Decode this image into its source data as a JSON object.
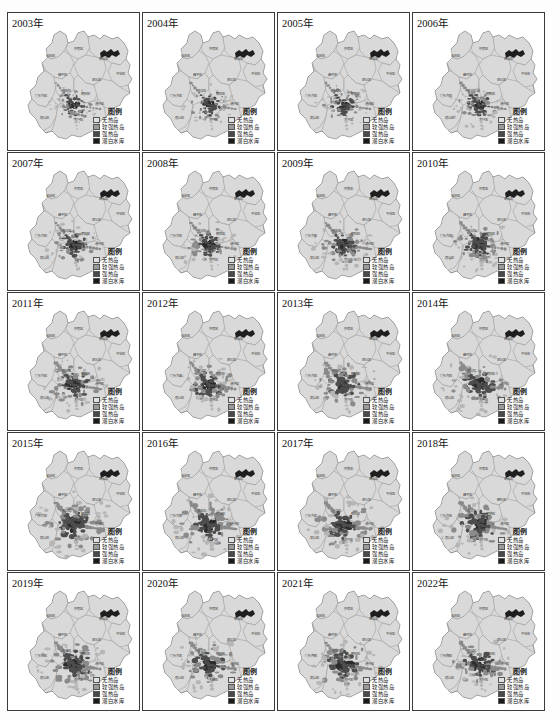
{
  "figure": {
    "kind": "map-grid",
    "rows": 5,
    "cols": 4,
    "background": "#ffffff",
    "border_color": "#3a3a3a"
  },
  "legend": {
    "title": "图例",
    "entries": [
      {
        "label": "无热岛",
        "color": "#e0e0e0"
      },
      {
        "label": "较强热岛",
        "color": "#9a9a9a"
      },
      {
        "label": "强热岛",
        "color": "#4a4a4a"
      },
      {
        "label": "潮白水库",
        "color": "#1a1a1a"
      }
    ]
  },
  "palette": {
    "land_fill": "#d9d9d9",
    "land_stroke": "#8c8c8c",
    "outline": "#6e6e6e",
    "heat_weak": "#b5b5b5",
    "heat_mid": "#8a8a8a",
    "heat_strong": "#4d4d4d",
    "heat_core": "#2b2b2b",
    "reservoir": "#1e1e1e",
    "label_text": "#4a4a4a"
  },
  "district_labels": [
    {
      "name": "延庆区",
      "x": 42,
      "y": 44
    },
    {
      "name": "怀柔区",
      "x": 70,
      "y": 37
    },
    {
      "name": "密云区",
      "x": 95,
      "y": 47
    },
    {
      "name": "昌平区",
      "x": 54,
      "y": 63
    },
    {
      "name": "顺义区",
      "x": 88,
      "y": 68
    },
    {
      "name": "平谷区",
      "x": 112,
      "y": 62
    },
    {
      "name": "门头沟区",
      "x": 33,
      "y": 84
    },
    {
      "name": "海淀区",
      "x": 58,
      "y": 79
    },
    {
      "name": "朝阳区",
      "x": 77,
      "y": 82
    },
    {
      "name": "通州区",
      "x": 91,
      "y": 92
    },
    {
      "name": "房山区",
      "x": 36,
      "y": 106
    },
    {
      "name": "大兴区",
      "x": 70,
      "y": 108
    }
  ],
  "panels": [
    {
      "id": "p2003",
      "year": "2003年",
      "heat_scale": 0.6,
      "heat_seed": 3
    },
    {
      "id": "p2004",
      "year": "2004年",
      "heat_scale": 0.64,
      "heat_seed": 4
    },
    {
      "id": "p2005",
      "year": "2005年",
      "heat_scale": 0.67,
      "heat_seed": 5
    },
    {
      "id": "p2006",
      "year": "2006年",
      "heat_scale": 0.7,
      "heat_seed": 6
    },
    {
      "id": "p2007",
      "year": "2007年",
      "heat_scale": 0.73,
      "heat_seed": 7
    },
    {
      "id": "p2008",
      "year": "2008年",
      "heat_scale": 0.76,
      "heat_seed": 8
    },
    {
      "id": "p2009",
      "year": "2009年",
      "heat_scale": 0.78,
      "heat_seed": 9
    },
    {
      "id": "p2010",
      "year": "2010年",
      "heat_scale": 0.81,
      "heat_seed": 10
    },
    {
      "id": "p2011",
      "year": "2011年",
      "heat_scale": 0.84,
      "heat_seed": 11
    },
    {
      "id": "p2012",
      "year": "2012年",
      "heat_scale": 0.86,
      "heat_seed": 12
    },
    {
      "id": "p2013",
      "year": "2013年",
      "heat_scale": 0.89,
      "heat_seed": 13
    },
    {
      "id": "p2014",
      "year": "2014年",
      "heat_scale": 0.92,
      "heat_seed": 14
    },
    {
      "id": "p2015",
      "year": "2015年",
      "heat_scale": 1.0,
      "heat_seed": 15
    },
    {
      "id": "p2016",
      "year": "2016年",
      "heat_scale": 0.95,
      "heat_seed": 16
    },
    {
      "id": "p2017",
      "year": "2017年",
      "heat_scale": 0.93,
      "heat_seed": 17
    },
    {
      "id": "p2018",
      "year": "2018年",
      "heat_scale": 0.96,
      "heat_seed": 18
    },
    {
      "id": "p2019",
      "year": "2019年",
      "heat_scale": 0.94,
      "heat_seed": 19
    },
    {
      "id": "p2020",
      "year": "2020年",
      "heat_scale": 0.88,
      "heat_seed": 20
    },
    {
      "id": "p2021",
      "year": "2021年",
      "heat_scale": 0.9,
      "heat_seed": 21
    },
    {
      "id": "p2022",
      "year": "2022年",
      "heat_scale": 0.87,
      "heat_seed": 22
    }
  ]
}
